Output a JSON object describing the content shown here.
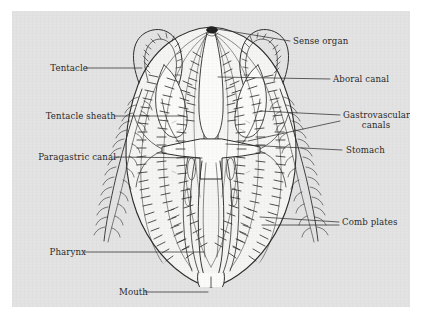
{
  "figure": {
    "organism": "comb jelly",
    "view": "tentacular plane, cutaway",
    "background_color": "#e3e3e3",
    "page_color": "#ffffff",
    "ink_color": "#262626",
    "body_fill": "#f4f4f2"
  },
  "labels": [
    {
      "id": "tentacle",
      "text": "Tentacle",
      "side": "left",
      "x": 28,
      "y": 61
    },
    {
      "id": "tentacle-sheath",
      "text": "Tentacle sheath",
      "side": "left",
      "x": 14,
      "y": 110
    },
    {
      "id": "paragastric-canal",
      "text": "Paragastric canal",
      "side": "left",
      "x": 12,
      "y": 150
    },
    {
      "id": "pharynx",
      "text": "Pharynx",
      "side": "left",
      "x": 25,
      "y": 245
    },
    {
      "id": "mouth",
      "text": "Mouth",
      "side": "left",
      "x": 107,
      "y": 285
    },
    {
      "id": "sense-organ",
      "text": "Sense organ",
      "side": "right",
      "x": 283,
      "y": 31
    },
    {
      "id": "aboral-canal",
      "text": "Aboral canal",
      "side": "right",
      "x": 322,
      "y": 72
    },
    {
      "id": "gastrovascular-canals",
      "text": "Gastrovascular",
      "text2": "canals",
      "side": "right",
      "x": 332,
      "y": 108
    },
    {
      "id": "stomach",
      "text": "Stomach",
      "side": "right",
      "x": 335,
      "y": 143
    },
    {
      "id": "comb-plates",
      "text": "Comb plates",
      "side": "right",
      "x": 331,
      "y": 214
    }
  ],
  "structures": [
    "sense organ",
    "aboral canal",
    "gastrovascular canals",
    "stomach",
    "comb plates",
    "pharynx",
    "mouth",
    "paragastric canal",
    "tentacle sheath",
    "tentacle"
  ]
}
